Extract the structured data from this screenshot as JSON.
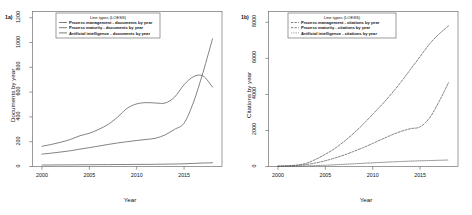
{
  "figure": {
    "panels": [
      {
        "label": "1a)",
        "ylabel": "Documents by year",
        "xlabel": "Year",
        "legend_title": "Line types (LOESS)",
        "legend_entries": [
          "Process management - documents by year",
          "Process maturity - documents by year",
          "Artificial intelligence - documents by year"
        ]
      },
      {
        "label": "1b)",
        "ylabel": "Citations by year",
        "xlabel": "Year",
        "legend_title": "Line types (LOESS)",
        "legend_entries": [
          "Process management - citations by year",
          "Process maturity - citations by year",
          "Artificial intelligence - citations by year"
        ]
      }
    ]
  },
  "chart_data": [
    {
      "type": "line",
      "title": "1a)",
      "xlabel": "Year",
      "ylabel": "Documents by year",
      "xlim": [
        1999,
        2019
      ],
      "ylim": [
        0,
        1250
      ],
      "xticks": [
        2000,
        2005,
        2010,
        2015
      ],
      "yticks": [
        0,
        200,
        400,
        600,
        800,
        1000,
        1200
      ],
      "grid": false,
      "legend_position": "top-center",
      "legend_title": "Line types (LOESS)",
      "x": [
        2000,
        2001,
        2002,
        2003,
        2004,
        2005,
        2006,
        2007,
        2008,
        2009,
        2010,
        2011,
        2012,
        2013,
        2014,
        2015,
        2016,
        2017,
        2018
      ],
      "series": [
        {
          "name": "Process management - documents by year",
          "linestyle": "solid",
          "values": [
            163,
            178,
            196,
            218,
            248,
            268,
            300,
            340,
            400,
            470,
            505,
            515,
            512,
            512,
            560,
            660,
            725,
            730,
            640
          ]
        },
        {
          "name": "Process maturity - documents by year",
          "linestyle": "solid",
          "values": [
            100,
            108,
            117,
            127,
            140,
            152,
            165,
            178,
            190,
            200,
            210,
            218,
            228,
            255,
            300,
            350,
            520,
            760,
            1030
          ]
        },
        {
          "name": "Artificial intelligence - documents by year",
          "linestyle": "solid",
          "values": [
            12,
            12,
            13,
            13,
            14,
            14,
            15,
            15,
            16,
            16,
            17,
            17,
            18,
            19,
            20,
            22,
            25,
            28,
            30
          ]
        }
      ]
    },
    {
      "type": "line",
      "title": "1b)",
      "xlabel": "Year",
      "ylabel": "Citations by year",
      "xlim": [
        1999,
        2019
      ],
      "ylim": [
        0,
        8600
      ],
      "xticks": [
        2000,
        2005,
        2010,
        2015
      ],
      "yticks": [
        0,
        2000,
        4000,
        6000,
        8000
      ],
      "grid": false,
      "legend_position": "top-center",
      "legend_title": "Line types (LOESS)",
      "x": [
        2000,
        2001,
        2002,
        2003,
        2004,
        2005,
        2006,
        2007,
        2008,
        2009,
        2010,
        2011,
        2012,
        2013,
        2014,
        2015,
        2016,
        2017,
        2018
      ],
      "series": [
        {
          "name": "Process management - citations by year",
          "linestyle": "dashed",
          "values": [
            20,
            40,
            80,
            180,
            400,
            680,
            1000,
            1400,
            1850,
            2350,
            2900,
            3450,
            4050,
            4700,
            5400,
            6100,
            6800,
            7350,
            7800
          ]
        },
        {
          "name": "Process maturity - citations by year",
          "linestyle": "dashed",
          "values": [
            15,
            30,
            60,
            110,
            200,
            320,
            470,
            640,
            840,
            1050,
            1280,
            1520,
            1750,
            1950,
            2100,
            2200,
            2700,
            3600,
            4650
          ]
        },
        {
          "name": "Artificial intelligence - citations by year",
          "linestyle": "dotted",
          "values": [
            5,
            10,
            18,
            30,
            48,
            70,
            95,
            122,
            150,
            178,
            205,
            230,
            255,
            278,
            298,
            315,
            330,
            345,
            360
          ]
        }
      ]
    }
  ]
}
